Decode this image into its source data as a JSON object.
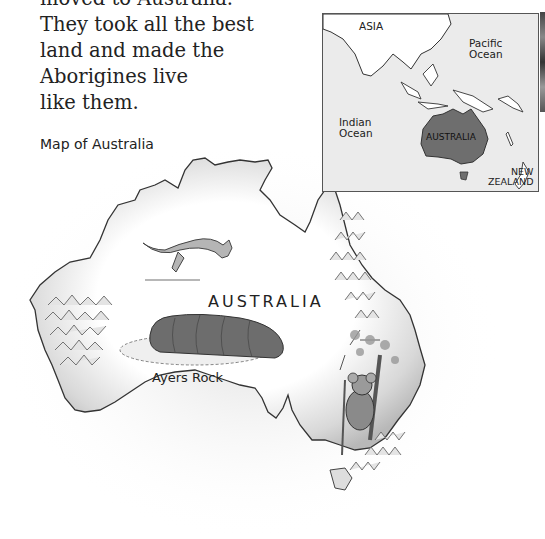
{
  "body_text": {
    "lines": [
      "moved to Australia.",
      "They took all the best",
      "land and made the",
      "Aborigines live",
      "like them."
    ]
  },
  "figure": {
    "caption": "Map of Australia",
    "main_map": {
      "title": "AUSTRALIA",
      "landmark_label": "Ayers Rock",
      "illustrations": [
        "kangaroo",
        "ayers-rock",
        "koala-in-tree",
        "mountains-west",
        "mountains-northeast",
        "mountains-southeast"
      ]
    },
    "inset_map": {
      "labels": {
        "asia": "ASIA",
        "pacific": "Pacific\nOcean",
        "indian": "Indian\nOcean",
        "australia": "AUSTRALIA",
        "new_zealand": "NEW\nZEALAND"
      },
      "colors": {
        "ocean": "#ebebeb",
        "land": "#ffffff",
        "australia_fill": "#6e6e6e",
        "border": "#555555"
      }
    }
  }
}
